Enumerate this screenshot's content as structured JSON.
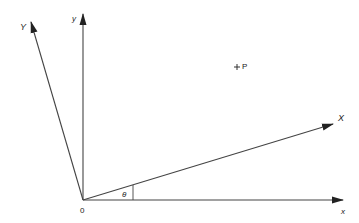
{
  "diagram": {
    "type": "coordinate-rotation",
    "origin": {
      "label": "0",
      "x": 83,
      "y": 200
    },
    "axes": [
      {
        "name": "x",
        "label": "x",
        "from": [
          83,
          200
        ],
        "to": [
          343,
          200
        ]
      },
      {
        "name": "y",
        "label": "y",
        "from": [
          83,
          200
        ],
        "to": [
          83,
          14
        ]
      },
      {
        "name": "X",
        "label": "X",
        "from": [
          83,
          200
        ],
        "to": [
          333,
          124
        ]
      },
      {
        "name": "Y",
        "label": "Y",
        "from": [
          83,
          200
        ],
        "to": [
          31,
          22
        ]
      }
    ],
    "angle": {
      "label": "θ",
      "between": [
        "x",
        "X"
      ]
    },
    "point": {
      "label": "P",
      "marker": "+",
      "x": 237,
      "y": 67
    }
  },
  "colors": {
    "line": "#333333",
    "background": "#ffffff"
  }
}
